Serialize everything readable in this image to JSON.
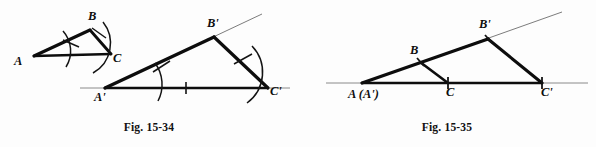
{
  "page": {
    "background_color": "#fdfdfd",
    "ink_color": "#111111",
    "width": 596,
    "height": 147
  },
  "figures": [
    {
      "id": "fig-15-34",
      "caption": "Fig. 15-34",
      "description": "Construction copying triangle ABC to triangle A'B'C' using compass arcs",
      "labels": {
        "A": "A",
        "B": "B",
        "C": "C",
        "A_prime": "A'",
        "B_prime": "B'",
        "C_prime": "C'"
      },
      "marks": {
        "arc_count": 5,
        "tick_count": 4,
        "baseline_tick": "single tick at midpoint of A'C'"
      }
    },
    {
      "id": "fig-15-35",
      "caption": "Fig. 15-35",
      "description": "Triangle ABC and enlarged similar triangle A'B'C' sharing vertex A",
      "labels": {
        "A": "A  (A')",
        "B": "B",
        "C": "C",
        "B_prime": "B'",
        "C_prime": "C'"
      },
      "marks": {
        "tick_count": 4,
        "baseline_tick": "ticks at C and C'"
      }
    }
  ]
}
